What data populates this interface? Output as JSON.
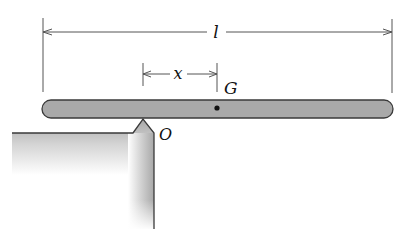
{
  "diagram": {
    "labels": {
      "length": "l",
      "offset": "x",
      "center_of_mass": "G",
      "pivot": "O"
    },
    "colors": {
      "bar_fill": "#a9a9a9",
      "bar_outline": "#3a3a3a",
      "support_fill": "#b5b5b5",
      "dimension_line": "#555555",
      "text": "#111111"
    },
    "geometry": {
      "bar": {
        "x": 42,
        "y": 100,
        "width": 351,
        "height": 18
      },
      "pivot_apex": {
        "x": 143,
        "y": 119
      },
      "G_point": {
        "x": 217,
        "y": 108
      },
      "l_dimension": {
        "x1": 43,
        "x2": 392,
        "y": 32
      },
      "x_dimension": {
        "x1": 143,
        "x2": 217,
        "y": 74
      }
    }
  }
}
